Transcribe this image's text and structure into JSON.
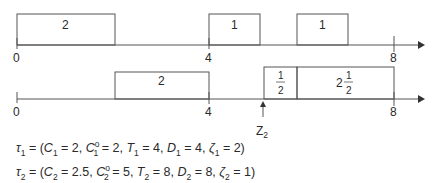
{
  "diagram": {
    "type": "schedule-timeline",
    "stroke_color": "#555555",
    "timeline_top": {
      "ticks": [
        {
          "label": "0",
          "time": 0
        },
        {
          "label": "4",
          "time": 4
        },
        {
          "label": "8",
          "time": 8
        }
      ],
      "blocks": [
        {
          "label": "2",
          "start": 0,
          "end": 2
        },
        {
          "label": "1",
          "start": 4,
          "end": 5
        },
        {
          "label": "1",
          "start": 6,
          "end": 7
        }
      ]
    },
    "timeline_bottom": {
      "ticks": [
        {
          "label": "0",
          "time": 0
        },
        {
          "label": "4",
          "time": 4
        },
        {
          "label": "8",
          "time": 8
        }
      ],
      "blocks": [
        {
          "label": "2",
          "start": 2,
          "end": 4
        },
        {
          "label_whole": "",
          "label_num": "1",
          "label_den": "2",
          "start": 5.25,
          "end": 6
        },
        {
          "label_whole": "2",
          "label_num": "1",
          "label_den": "2",
          "start": 6,
          "end": 8
        }
      ],
      "marker": {
        "label": "Z",
        "subscript": "2",
        "time": 5.25
      }
    },
    "tasks": [
      {
        "symbol": "τ",
        "index": "1",
        "text": "τ1 = (C1 = 2, C1o = 2, T1 = 4, D1 = 4, ζ1 = 2)",
        "C": "2",
        "Co": "2",
        "T": "4",
        "D": "4",
        "zeta": "2"
      },
      {
        "symbol": "τ",
        "index": "2",
        "text": "τ2 = (C2 = 2.5, C2o = 5, T2 = 8, D2 = 8, ζ2 = 1)",
        "C": "2.5",
        "Co": "5",
        "T": "8",
        "D": "8",
        "zeta": "1"
      }
    ]
  }
}
